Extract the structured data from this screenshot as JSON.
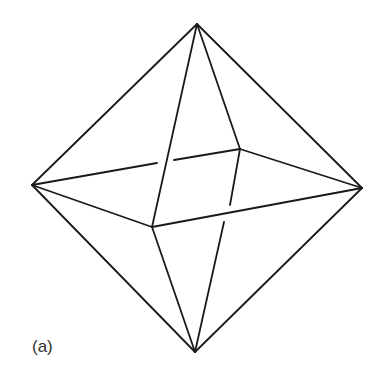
{
  "diagram": {
    "label": "(a)",
    "stroke_color": "#1a1a1a",
    "vertices": {
      "top": [
        197,
        24
      ],
      "left": [
        32,
        185
      ],
      "right": [
        362,
        188
      ],
      "bottom": [
        195,
        352
      ],
      "back": [
        240,
        149
      ],
      "front": [
        152,
        227
      ]
    },
    "edges": [
      {
        "from": "top",
        "to": "left",
        "segments": [
          [
            [
              197,
              24
            ],
            [
              32,
              185
            ]
          ]
        ]
      },
      {
        "from": "top",
        "to": "right",
        "segments": [
          [
            [
              197,
              24
            ],
            [
              362,
              188
            ]
          ]
        ]
      },
      {
        "from": "top",
        "to": "front",
        "segments": [
          [
            [
              197,
              24
            ],
            [
              152,
              227
            ]
          ]
        ]
      },
      {
        "from": "top",
        "to": "back",
        "segments": [
          [
            [
              197,
              24
            ],
            [
              240,
              149
            ]
          ]
        ]
      },
      {
        "from": "bottom",
        "to": "left",
        "segments": [
          [
            [
              195,
              352
            ],
            [
              32,
              185
            ]
          ]
        ]
      },
      {
        "from": "bottom",
        "to": "right",
        "segments": [
          [
            [
              195,
              352
            ],
            [
              362,
              188
            ]
          ]
        ]
      },
      {
        "from": "bottom",
        "to": "front",
        "segments": [
          [
            [
              195,
              352
            ],
            [
              152,
              227
            ]
          ]
        ]
      },
      {
        "from": "bottom",
        "to": "back",
        "segments": [
          [
            [
              240,
              149
            ],
            [
              230,
              205
            ]
          ],
          [
            [
              224,
              222
            ],
            [
              195,
              352
            ]
          ]
        ]
      },
      {
        "from": "left",
        "to": "back",
        "segments": [
          [
            [
              32,
              185
            ],
            [
              157,
              163
            ]
          ],
          [
            [
              174,
              160
            ],
            [
              240,
              149
            ]
          ]
        ]
      },
      {
        "from": "left",
        "to": "front",
        "segments": [
          [
            [
              32,
              185
            ],
            [
              152,
              227
            ]
          ]
        ]
      },
      {
        "from": "right",
        "to": "back",
        "segments": [
          [
            [
              240,
              149
            ],
            [
              362,
              188
            ]
          ]
        ]
      },
      {
        "from": "right",
        "to": "front",
        "segments": [
          [
            [
              152,
              227
            ],
            [
              362,
              188
            ]
          ]
        ]
      }
    ]
  }
}
